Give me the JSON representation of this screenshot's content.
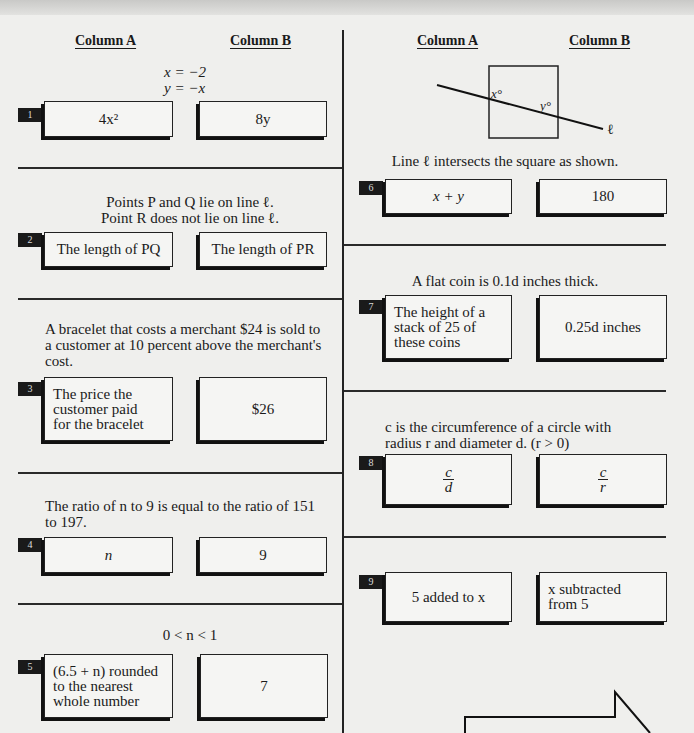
{
  "page": {
    "column_headers": {
      "left": {
        "a": "Column A",
        "b": "Column B"
      },
      "right": {
        "a": "Column A",
        "b": "Column B"
      }
    }
  },
  "questions": [
    {
      "number": "1",
      "stem_lines": [
        "x = −2",
        "y = −x"
      ],
      "column_a": "4x²",
      "column_b": "8y"
    },
    {
      "number": "2",
      "stem_lines": [
        "Points  P  and  Q  lie on line  ℓ.",
        "Point  R  does not lie on line ℓ."
      ],
      "column_a": "The length of  PQ",
      "column_b": "The length of  PR"
    },
    {
      "number": "3",
      "stem_lines": [
        "A bracelet that costs a merchant $24 is sold to",
        "a customer at 10 percent above the merchant's",
        "cost."
      ],
      "column_a": "The price the\ncustomer paid\nfor the bracelet",
      "column_b": "$26"
    },
    {
      "number": "4",
      "stem_lines": [
        "The ratio of  n  to 9 is equal to the ratio of 151",
        "to 197."
      ],
      "column_a": "n",
      "column_b": "9"
    },
    {
      "number": "5",
      "stem_lines": [
        "0 < n < 1"
      ],
      "column_a": "(6.5 + n) rounded\nto the nearest\nwhole number",
      "column_b": "7"
    },
    {
      "number": "6",
      "figure": {
        "angle_x_label": "x°",
        "angle_y_label": "y°",
        "line_label": "ℓ"
      },
      "stem_lines": [
        "Line  ℓ  intersects the square as shown."
      ],
      "column_a": "x + y",
      "column_b": "180"
    },
    {
      "number": "7",
      "stem_lines": [
        "A flat coin is  0.1d  inches thick."
      ],
      "column_a": "The height of a\nstack of 25 of\nthese coins",
      "column_b": "0.25d  inches"
    },
    {
      "number": "8",
      "stem_lines": [
        "c  is the circumference of a circle with",
        "radius  r  and diameter  d.  (r > 0)"
      ],
      "column_a": {
        "numerator": "c",
        "denominator": "d"
      },
      "column_b": {
        "numerator": "c",
        "denominator": "r"
      }
    },
    {
      "number": "9",
      "stem_lines": [],
      "column_a": "5 added to  x",
      "column_b": "x  subtracted\nfrom 5"
    }
  ],
  "navigation": {
    "next_arrow_icon": "right-arrow-icon"
  }
}
